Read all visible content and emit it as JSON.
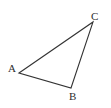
{
  "figure": {
    "kind": "geometry-diagram",
    "shape_name": "triangle",
    "background_color": "#ffffff",
    "stroke_color": "#333333",
    "stroke_width": 1.1,
    "label_color": "#2e2e2e",
    "canvas": {
      "width": 111,
      "height": 108
    }
  },
  "vertices": [
    {
      "label": "A",
      "x": 19,
      "y": 73,
      "label_x": 8,
      "label_y": 63
    },
    {
      "label": "B",
      "x": 71,
      "y": 88,
      "label_x": 69,
      "label_y": 91
    },
    {
      "label": "C",
      "x": 93,
      "y": 22,
      "label_x": 91,
      "label_y": 11
    }
  ],
  "edges": [
    {
      "name": "edge-A-C",
      "from": "A",
      "to": "C"
    },
    {
      "name": "edge-C-B",
      "from": "C",
      "to": "B"
    },
    {
      "name": "edge-B-A",
      "from": "B",
      "to": "A"
    }
  ],
  "polygon_points": "19,73 93,22 71,88"
}
